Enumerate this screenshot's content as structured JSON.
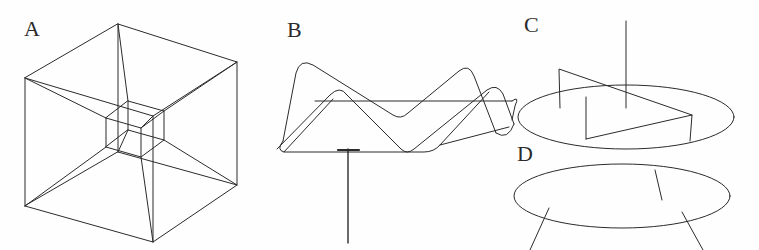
{
  "figure": {
    "background_color": "#fefefe",
    "stroke_color": "#2b2b2b",
    "stroke_width": 1.0,
    "width": 759,
    "height": 250,
    "panels": [
      {
        "id": "A",
        "label": "A",
        "label_x": 24,
        "label_y": 18,
        "description": "Tesseract / hypercube wireframe: outer cube in oblique projection with a smaller inner cube connected vertex-to-vertex by diagonal edges"
      },
      {
        "id": "B",
        "label": "B",
        "label_x": 287,
        "label_y": 19,
        "description": "Pleated zigzag ribbon surface with rounded fold corners, drawn in perspective, with a straight vertical stem descending from its lower edge"
      },
      {
        "id": "C",
        "label": "C",
        "label_x": 524,
        "label_y": 14,
        "description": "Upper ellipse disc with a helicoid ramp cut and a vertical axis line rising through its centre"
      },
      {
        "id": "D",
        "label": "D",
        "label_x": 517,
        "label_y": 143,
        "description": "Lower ellipse disc with three straight leg lines radiating downward and one short line on its upper surface"
      }
    ]
  },
  "geometry": {
    "panel_A": {
      "outer_cube": {
        "front_face": [
          [
            25,
            78
          ],
          [
            153,
            116
          ],
          [
            237,
            62
          ],
          [
            118,
            24
          ]
        ],
        "back_face": [
          [
            25,
            206
          ],
          [
            153,
            242
          ],
          [
            237,
            185
          ],
          [
            118,
            152
          ]
        ],
        "vertical_edges": [
          [
            [
              25,
              78
            ],
            [
              25,
              206
            ]
          ],
          [
            [
              153,
              116
            ],
            [
              153,
              242
            ]
          ],
          [
            [
              237,
              62
            ],
            [
              237,
              185
            ]
          ],
          [
            [
              118,
              24
            ],
            [
              118,
              152
            ]
          ]
        ]
      },
      "inner_cube": {
        "front_face": [
          [
            106,
            118
          ],
          [
            141,
            128
          ],
          [
            164,
            111
          ],
          [
            128,
            101
          ]
        ],
        "back_face": [
          [
            106,
            147
          ],
          [
            141,
            157
          ],
          [
            164,
            140
          ],
          [
            128,
            130
          ]
        ],
        "vertical_edges": [
          [
            [
              106,
              118
            ],
            [
              106,
              147
            ]
          ],
          [
            [
              141,
              128
            ],
            [
              141,
              157
            ]
          ],
          [
            [
              164,
              111
            ],
            [
              164,
              140
            ]
          ],
          [
            [
              128,
              101
            ],
            [
              128,
              130
            ]
          ]
        ]
      },
      "connector_edges": [
        [
          [
            25,
            78
          ],
          [
            106,
            118
          ]
        ],
        [
          [
            153,
            116
          ],
          [
            141,
            128
          ]
        ],
        [
          [
            237,
            62
          ],
          [
            164,
            111
          ]
        ],
        [
          [
            118,
            24
          ],
          [
            128,
            101
          ]
        ],
        [
          [
            25,
            206
          ],
          [
            106,
            147
          ]
        ],
        [
          [
            153,
            242
          ],
          [
            141,
            157
          ]
        ],
        [
          [
            237,
            185
          ],
          [
            164,
            140
          ]
        ],
        [
          [
            118,
            152
          ],
          [
            128,
            130
          ]
        ]
      ]
    },
    "panel_B": {
      "ribbon_corners_top": [
        [
          285,
          131
        ],
        [
          345,
          48
        ],
        [
          404,
          120
        ],
        [
          465,
          70
        ],
        [
          497,
          129
        ]
      ],
      "ribbon_corners_bottom": [
        [
          279,
          148
        ],
        [
          338,
          72
        ],
        [
          398,
          140
        ],
        [
          458,
          92
        ],
        [
          492,
          148
        ]
      ],
      "stem": {
        "x": 348,
        "y_top": 148,
        "y_bottom": 243
      }
    },
    "panel_C": {
      "ellipse": {
        "cx": 626,
        "cy": 117,
        "rx": 108,
        "ry": 32
      },
      "axis_line": {
        "x": 626,
        "y_top": 21,
        "y_bottom": 108
      },
      "ramp_path": [
        [
          561,
          107
        ],
        [
          559,
          68
        ],
        [
          692,
          115
        ],
        [
          688,
          139
        ],
        [
          585,
          139
        ],
        [
          585,
          96
        ]
      ]
    },
    "panel_D": {
      "ellipse": {
        "cx": 622,
        "cy": 196,
        "rx": 108,
        "ry": 32
      },
      "inner_line": [
        [
          655,
          172
        ],
        [
          661,
          199
        ]
      ],
      "legs": [
        [
          [
            549,
            208
          ],
          [
            530,
            250
          ]
        ],
        [
          [
            682,
            211
          ],
          [
            703,
            250
          ]
        ]
      ]
    }
  }
}
